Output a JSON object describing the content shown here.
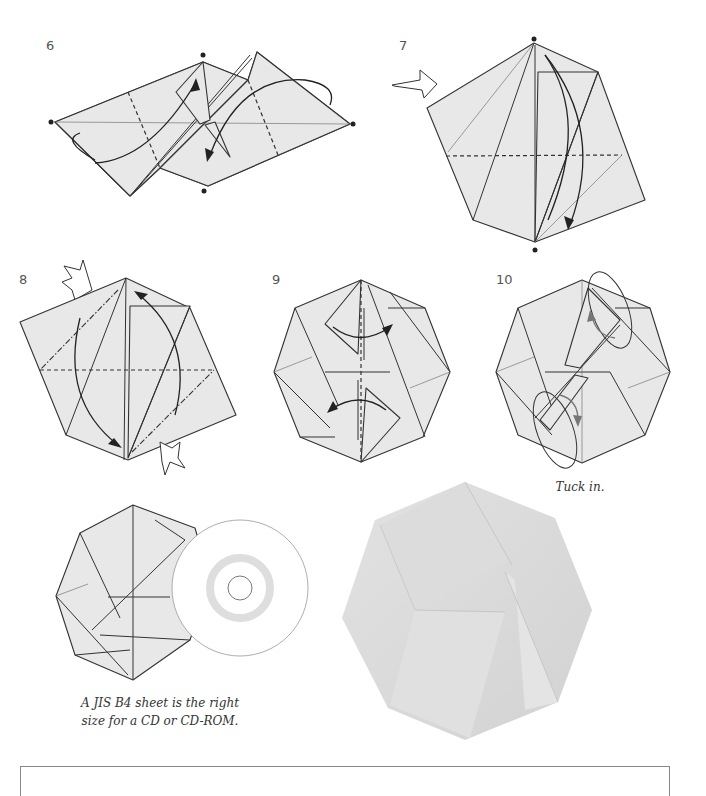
{
  "steps": [
    {
      "number": "6",
      "description": "Fold both halves along valley folds with swivel arrows"
    },
    {
      "number": "7",
      "description": "Turn over / view indicator arrow, fold along horizontal valley"
    },
    {
      "number": "8",
      "description": "Squash folds with mountain and valley creases"
    },
    {
      "number": "9",
      "description": "Fold flaps to the sides"
    },
    {
      "number": "10",
      "description": "Tuck in the flaps",
      "caption": "Tuck in."
    }
  ],
  "cd_illustration": {
    "caption_line1": "A JIS B4 sheet is the right",
    "caption_line2": "size for a CD or CD-ROM."
  },
  "photo": {
    "subject": "finished-octagonal-origami-case"
  },
  "note_box": {
    "heading": ""
  },
  "colors": {
    "paper_fill": "#e8e8e8",
    "line": "#333333",
    "grey_arrow": "#777777",
    "photo_paper": "#dcdcdc"
  }
}
